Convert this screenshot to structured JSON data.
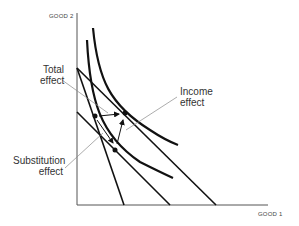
{
  "diagram": {
    "type": "indifference-curve",
    "axes": {
      "y_label": "GOOD 2",
      "x_label": "GOOD 1"
    },
    "annotations": {
      "total": {
        "line1": "Total",
        "line2": "effect"
      },
      "income": {
        "line1": "Income",
        "line2": "effect"
      },
      "substitution": {
        "line1": "Substitution",
        "line2": "effect"
      }
    },
    "colors": {
      "line": "#111111",
      "leader": "#888888",
      "text": "#333333"
    }
  }
}
